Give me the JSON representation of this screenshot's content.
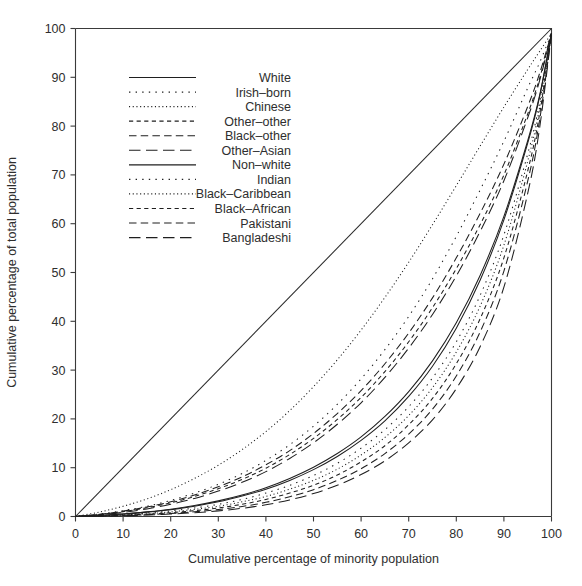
{
  "chart_data": {
    "type": "line",
    "title": "",
    "subtitle": "",
    "xlabel": "Cumulative percentage of minority population",
    "ylabel": "Cumulative percentage of total population",
    "xlim": [
      0,
      100
    ],
    "ylim": [
      0,
      100
    ],
    "xticks": [
      0,
      10,
      20,
      30,
      40,
      50,
      60,
      70,
      80,
      90,
      100
    ],
    "yticks": [
      0,
      10,
      20,
      30,
      40,
      50,
      60,
      70,
      80,
      90,
      100
    ],
    "grid": false,
    "legend_position": "upper-left-inside",
    "annotations": [
      {
        "name": "equality-diagonal",
        "text": "line of equality",
        "from": [
          0,
          0
        ],
        "to": [
          100,
          100
        ]
      }
    ],
    "x": [
      0,
      5,
      10,
      15,
      20,
      25,
      30,
      35,
      40,
      45,
      50,
      55,
      60,
      65,
      70,
      75,
      80,
      85,
      90,
      95,
      97.5,
      100
    ],
    "series": [
      {
        "name": "White",
        "dash": "solid",
        "values": [
          0,
          0.2,
          0.5,
          0.9,
          1.4,
          2.1,
          3.0,
          4.2,
          5.6,
          7.4,
          9.6,
          12.3,
          15.6,
          19.6,
          24.6,
          30.8,
          38.6,
          48.4,
          60.8,
          76.5,
          86.0,
          99.0
        ]
      },
      {
        "name": "Irish–born",
        "dash": "sparse-dot",
        "values": [
          0,
          0.5,
          1.2,
          2.1,
          3.3,
          4.8,
          6.6,
          8.8,
          11.5,
          14.7,
          18.5,
          23.0,
          28.2,
          34.2,
          41.0,
          48.7,
          57.4,
          66.9,
          76.9,
          87.8,
          93.0,
          99.0
        ]
      },
      {
        "name": "Chinese",
        "dash": "fine-dot",
        "values": [
          0,
          0.9,
          2.1,
          3.6,
          5.5,
          7.8,
          10.5,
          13.7,
          17.4,
          21.7,
          26.6,
          32.1,
          38.2,
          44.9,
          52.1,
          59.8,
          67.8,
          75.9,
          83.9,
          91.6,
          95.3,
          99.0
        ]
      },
      {
        "name": "Other–other",
        "dash": "short-dash",
        "values": [
          0,
          0.4,
          1.0,
          1.8,
          2.8,
          4.1,
          5.7,
          7.6,
          9.9,
          12.7,
          16.0,
          19.9,
          24.4,
          29.7,
          35.8,
          42.8,
          50.8,
          59.8,
          70.0,
          82.5,
          89.8,
          99.0
        ]
      },
      {
        "name": "Black–other",
        "dash": "medium-dash",
        "values": [
          0,
          0.45,
          1.1,
          1.95,
          3.0,
          4.4,
          6.1,
          8.1,
          10.6,
          13.5,
          17.0,
          21.1,
          25.8,
          31.3,
          37.6,
          44.8,
          53.0,
          62.1,
          72.2,
          84.0,
          90.8,
          99.0
        ]
      },
      {
        "name": "Other–Asian",
        "dash": "long-dash",
        "values": [
          0,
          0.35,
          0.85,
          1.55,
          2.5,
          3.7,
          5.2,
          7.0,
          9.2,
          11.9,
          15.1,
          18.9,
          23.3,
          28.5,
          34.5,
          41.4,
          49.3,
          58.4,
          68.8,
          81.7,
          89.3,
          99.0
        ]
      },
      {
        "name": "Non–white",
        "dash": "solid",
        "values": [
          0,
          0.2,
          0.5,
          0.95,
          1.5,
          2.25,
          3.2,
          4.4,
          5.9,
          7.8,
          10.1,
          12.9,
          16.3,
          20.5,
          25.6,
          31.9,
          39.7,
          49.4,
          61.5,
          77.0,
          86.3,
          99.0
        ]
      },
      {
        "name": "Indian",
        "dash": "sparse-dot",
        "values": [
          0,
          0.15,
          0.4,
          0.7,
          1.15,
          1.75,
          2.5,
          3.5,
          4.8,
          6.4,
          8.4,
          10.9,
          14.0,
          17.8,
          22.5,
          28.4,
          35.8,
          45.3,
          57.7,
          74.3,
          84.8,
          99.0
        ]
      },
      {
        "name": "Black–Caribbean",
        "dash": "fine-dot",
        "values": [
          0,
          0.12,
          0.32,
          0.58,
          0.95,
          1.45,
          2.1,
          3.0,
          4.1,
          5.6,
          7.4,
          9.7,
          12.6,
          16.2,
          20.7,
          26.4,
          33.7,
          43.1,
          55.6,
          72.8,
          83.8,
          99.0
        ]
      },
      {
        "name": "Black–African",
        "dash": "short-dash",
        "values": [
          0,
          0.1,
          0.26,
          0.48,
          0.78,
          1.2,
          1.75,
          2.5,
          3.5,
          4.8,
          6.4,
          8.5,
          11.2,
          14.5,
          18.8,
          24.2,
          31.3,
          40.5,
          53.0,
          70.8,
          82.5,
          99.0
        ]
      },
      {
        "name": "Pakistani",
        "dash": "medium-dash",
        "values": [
          0,
          0.08,
          0.2,
          0.38,
          0.62,
          0.96,
          1.42,
          2.05,
          2.9,
          4.05,
          5.5,
          7.4,
          9.8,
          12.9,
          16.9,
          22.0,
          28.8,
          37.8,
          50.3,
          68.7,
          81.2,
          99.0
        ]
      },
      {
        "name": "Bangladeshi",
        "dash": "long-dash",
        "values": [
          0,
          0.06,
          0.16,
          0.3,
          0.5,
          0.78,
          1.15,
          1.68,
          2.4,
          3.4,
          4.7,
          6.4,
          8.6,
          11.4,
          15.1,
          19.8,
          26.2,
          34.8,
          47.0,
          66.2,
          79.6,
          99.0
        ]
      }
    ]
  },
  "legend": {
    "entries": [
      {
        "label": "White",
        "dash": "solid"
      },
      {
        "label": "Irish–born",
        "dash": "sparse-dot"
      },
      {
        "label": "Chinese",
        "dash": "fine-dot"
      },
      {
        "label": "Other–other",
        "dash": "short-dash"
      },
      {
        "label": "Black–other",
        "dash": "medium-dash"
      },
      {
        "label": "Other–Asian",
        "dash": "long-dash"
      },
      {
        "label": "Non–white",
        "dash": "solid"
      },
      {
        "label": "Indian",
        "dash": "sparse-dot"
      },
      {
        "label": "Black–Caribbean",
        "dash": "fine-dot"
      },
      {
        "label": "Black–African",
        "dash": "short-dash"
      },
      {
        "label": "Pakistani",
        "dash": "medium-dash"
      },
      {
        "label": "Bangladeshi",
        "dash": "long-dash"
      }
    ]
  },
  "colors": {
    "ink": "#1f1f1f",
    "axis": "#3a3a3a",
    "background": "#ffffff"
  }
}
